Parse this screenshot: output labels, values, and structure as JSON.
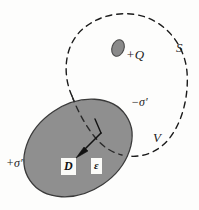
{
  "figure": {
    "background_color": "#fdfdfc",
    "line_color": "#1b1b1b",
    "dielectric_fill": "#8f8f8f",
    "dielectric_stroke": "#3a3a3a",
    "charge_fill": "#8a8a8a",
    "label_box_fill": "#fbfbf8"
  },
  "labels": {
    "free_charge": "+Q",
    "surface": "S",
    "bound_negative": "−σ′",
    "volume": "V",
    "bound_positive": "+σ′",
    "displacement_field": "D",
    "permittivity": "ε"
  },
  "shapes": {
    "gaussian_surface": {
      "name": "dashed-closed-surface",
      "style": "dashed",
      "stroke_width": 1.4,
      "dash_pattern": "6 5"
    },
    "dielectric_body": {
      "name": "gray-ellipse",
      "center_x": 78,
      "center_y": 148,
      "radius_x": 58,
      "radius_y": 44,
      "rotation_deg": -34
    },
    "point_charge": {
      "name": "small-gray-ellipse",
      "center_x": 118,
      "center_y": 48,
      "radius_x": 6,
      "radius_y": 8.5,
      "rotation_deg": 20
    },
    "field_vector": {
      "name": "displacement-arrow",
      "from_x": 101,
      "from_y": 133,
      "to_x": 77,
      "to_y": 157
    },
    "normal_tick": {
      "name": "surface-normal-tick",
      "from_x": 101,
      "from_y": 133,
      "to_x": 95,
      "to_y": 119
    }
  }
}
